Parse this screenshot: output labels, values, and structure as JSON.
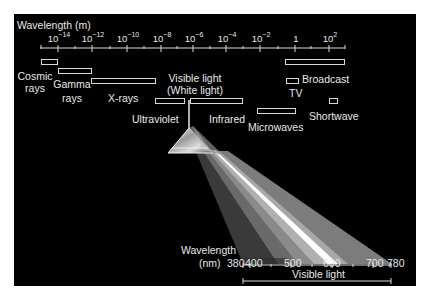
{
  "diagram": {
    "axis_title": "Wavelength (m)",
    "axis_ticks": [
      {
        "base": "10",
        "exp": "−14",
        "x": 58
      },
      {
        "base": "10",
        "exp": "−12",
        "x": 92
      },
      {
        "base": "10",
        "exp": "−10",
        "x": 127
      },
      {
        "base": "10",
        "exp": "−8",
        "x": 161
      },
      {
        "base": "10",
        "exp": "−6",
        "x": 193
      },
      {
        "base": "10",
        "exp": "−4",
        "x": 226
      },
      {
        "base": "10",
        "exp": "−2",
        "x": 260
      },
      {
        "base": "1",
        "exp": "",
        "x": 295
      },
      {
        "base": "10",
        "exp": "2",
        "x": 329
      }
    ],
    "bands": {
      "cosmic_rays": {
        "line1": "Cosmic",
        "line2": "rays"
      },
      "gamma_rays": {
        "line1": "Gamma",
        "line2": "rays"
      },
      "x_rays": "X-rays",
      "visible_light": {
        "line1": "Visible light",
        "line2": "(White light)"
      },
      "ultraviolet": "Ultraviolet",
      "infrared": "Infrared",
      "microwaves": "Microwaves",
      "broadcast": "Broadcast",
      "tv": "TV",
      "shortwave": "Shortwave"
    },
    "visible_scale": {
      "title_line1": "Wavelength",
      "title_line2": "(nm)",
      "ticks": [
        "380",
        "400",
        "500",
        "600",
        "700",
        "780"
      ],
      "range_label": "Visible light"
    },
    "colors": {
      "background": "#000000",
      "foreground": "#e8e8e8",
      "page": "#ffffff"
    }
  }
}
